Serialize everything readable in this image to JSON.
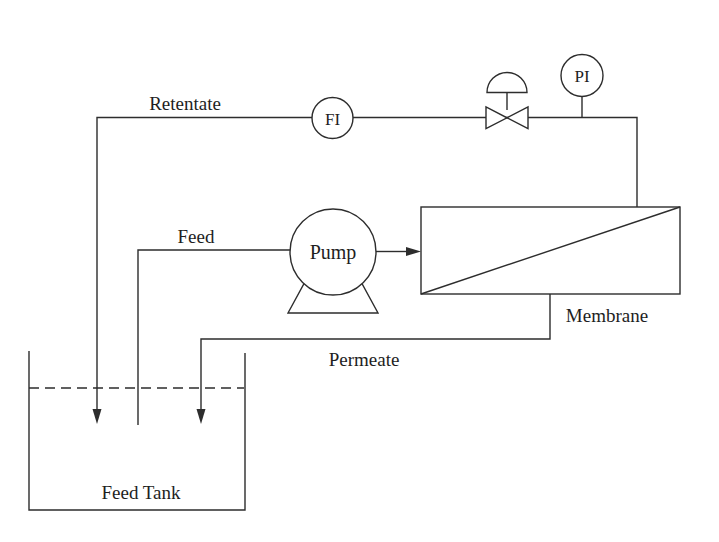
{
  "diagram": {
    "type": "process-flow-diagram",
    "labels": {
      "retentate": "Retentate",
      "feed": "Feed",
      "permeate": "Permeate",
      "membrane": "Membrane",
      "feed_tank": "Feed Tank",
      "pump": "Pump"
    },
    "instruments": {
      "fi": {
        "tag": "FI",
        "meaning": "flow-indicator"
      },
      "pi": {
        "tag": "PI",
        "meaning": "pressure-indicator"
      }
    },
    "streams": [
      "Retentate",
      "Feed",
      "Permeate"
    ],
    "equipment": [
      "Feed Tank",
      "Pump",
      "Membrane"
    ],
    "colors": {
      "line": "#2d2d2d",
      "text": "#1e1e1e",
      "background": "#ffffff"
    }
  }
}
